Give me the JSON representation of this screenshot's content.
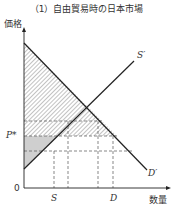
{
  "title": "（1）自由貿易時の日本市場",
  "axes": {
    "y_label": "価格",
    "x_label": "数量",
    "origin": "0"
  },
  "labels": {
    "supply": "S′",
    "demand": "D′",
    "price": "P*",
    "quantity_supplied": "S",
    "quantity_demanded": "D"
  },
  "colors": {
    "line": "#222222",
    "dashed": "#555555",
    "hatch": "#666666",
    "gray_fill": "#cfcfcf"
  }
}
